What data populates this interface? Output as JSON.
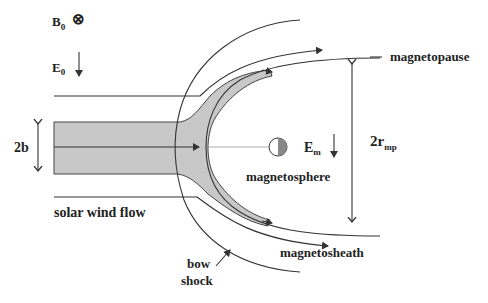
{
  "diagram": {
    "labels": {
      "b0": "B",
      "b0_sub": "0",
      "b0_symbol": "⊗",
      "e0": "E",
      "e0_sub": "0",
      "em": "E",
      "em_sub": "m",
      "two_b": "2b",
      "two_rmp": "2r",
      "two_rmp_sub": "mp",
      "magnetopause": "magnetopause",
      "magnetosphere": "magnetosphere",
      "magnetosheath": "magnetosheath",
      "solar_wind_flow": "solar wind flow",
      "bow": "bow",
      "shock": "shock"
    },
    "colors": {
      "flow_fill": "#c8c8c8",
      "line": "#333333",
      "planet_dark": "#888888"
    }
  }
}
